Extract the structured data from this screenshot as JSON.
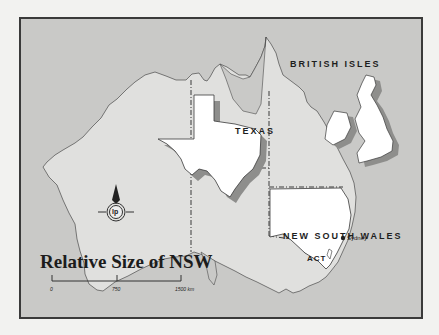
{
  "map": {
    "title": "Relative Size of NSW",
    "labels": {
      "british_isles": "BRITISH ISLES",
      "texas": "TEXAS",
      "nsw": "NEW SOUTH WALES",
      "act": "ACT",
      "sydney": "Sydney"
    },
    "scale": {
      "ticks": [
        "0",
        "750",
        "1500 km"
      ]
    },
    "logo": "lp",
    "colors": {
      "sea": "#c9c9c7",
      "land": "#e0e0de",
      "highlight": "#ffffff",
      "shadow": "#8e8e8c",
      "border": "#3a3a3a"
    }
  }
}
